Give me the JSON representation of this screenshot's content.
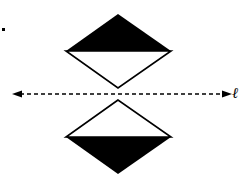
{
  "figure": {
    "line_label": "ℓ",
    "colors": {
      "fill": "#000000",
      "stroke": "#000000",
      "background": "#ffffff"
    },
    "upper_shape": {
      "type": "diamond",
      "top_half": "filled",
      "bottom_half": "empty"
    },
    "lower_shape": {
      "type": "diamond",
      "top_half": "empty",
      "bottom_half": "filled"
    },
    "axis": {
      "style": "dashed",
      "arrows": "both-ends",
      "description": "line of reflection"
    }
  }
}
